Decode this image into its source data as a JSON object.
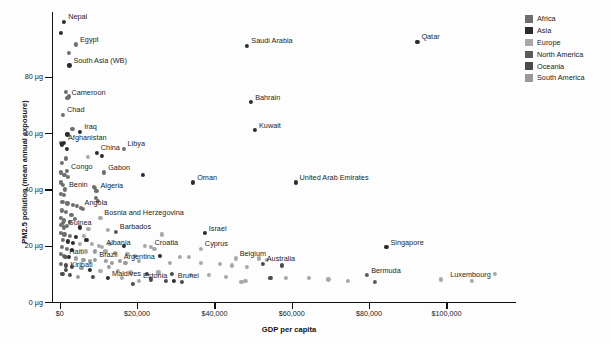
{
  "chart_data": {
    "type": "scatter",
    "title": "",
    "xlabel": "GDP per capita",
    "ylabel": "PM2.5 pollution (mean annual exposure)",
    "xlim": [
      -2000,
      118000
    ],
    "ylim": [
      0,
      103
    ],
    "xticks": [
      0,
      20000,
      40000,
      60000,
      80000,
      100000
    ],
    "xticklabels": [
      "$0",
      "$20,000",
      "$40,000",
      "$60,000",
      "$80,000",
      "$100,000"
    ],
    "yticks": [
      0,
      20,
      40,
      60,
      80
    ],
    "yticklabels": [
      "0 µg",
      "20 µg",
      "40 µg",
      "60 µg",
      "80 µg"
    ],
    "grid": false,
    "legend_position": "top-right",
    "legend": [
      {
        "name": "Africa",
        "color": "#6e6e6e"
      },
      {
        "name": "Asia",
        "color": "#2b2b2b"
      },
      {
        "name": "Europe",
        "color": "#a8a8a8"
      },
      {
        "name": "North America",
        "color": "#5a5a5a"
      },
      {
        "name": "Oceania",
        "color": "#4a4a4a"
      },
      {
        "name": "South America",
        "color": "#9a9a9a"
      }
    ],
    "labeled_points": [
      {
        "name": "Nepal",
        "x": 1150,
        "y": 99.5,
        "group": "Asia",
        "anchor": "right"
      },
      {
        "name": "Egypt",
        "x": 4200,
        "y": 91.5,
        "group": "Africa",
        "anchor": "right"
      },
      {
        "name": "South Asia (WB)",
        "x": 2500,
        "y": 84.0,
        "group": "Asia",
        "anchor": "right"
      },
      {
        "name": "Saudi Arabia",
        "x": 48500,
        "y": 91.0,
        "group": "Asia",
        "anchor": "right"
      },
      {
        "name": "Qatar",
        "x": 92500,
        "y": 92.5,
        "group": "Asia",
        "anchor": "right"
      },
      {
        "name": "Cameroon",
        "x": 2000,
        "y": 72.5,
        "group": "Africa",
        "anchor": "right"
      },
      {
        "name": "Chad",
        "x": 850,
        "y": 66.5,
        "group": "Africa",
        "anchor": "right"
      },
      {
        "name": "Bahrain",
        "x": 49500,
        "y": 71.0,
        "group": "Asia",
        "anchor": "right"
      },
      {
        "name": "Kuwait",
        "x": 50500,
        "y": 61.0,
        "group": "Asia",
        "anchor": "right"
      },
      {
        "name": "Iraq",
        "x": 5300,
        "y": 60.5,
        "group": "Asia",
        "anchor": "right"
      },
      {
        "name": "Afghanistan",
        "x": 1100,
        "y": 56.5,
        "group": "Asia",
        "anchor": "right"
      },
      {
        "name": "China",
        "x": 9600,
        "y": 53.0,
        "group": "Asia",
        "anchor": "right"
      },
      {
        "name": "Libya",
        "x": 16500,
        "y": 54.5,
        "group": "Africa",
        "anchor": "right"
      },
      {
        "name": "Congo",
        "x": 1900,
        "y": 46.5,
        "group": "Africa",
        "anchor": "right"
      },
      {
        "name": "Gabon",
        "x": 11500,
        "y": 46.0,
        "group": "Africa",
        "anchor": "right"
      },
      {
        "name": "Oman",
        "x": 34500,
        "y": 42.5,
        "group": "Asia",
        "anchor": "right"
      },
      {
        "name": "United Arab Emirates",
        "x": 61000,
        "y": 42.5,
        "group": "Asia",
        "anchor": "right"
      },
      {
        "name": "Benin",
        "x": 1350,
        "y": 40.0,
        "group": "Africa",
        "anchor": "right"
      },
      {
        "name": "Algeria",
        "x": 9500,
        "y": 39.5,
        "group": "Africa",
        "anchor": "right"
      },
      {
        "name": "Angola",
        "x": 5400,
        "y": 33.5,
        "group": "Africa",
        "anchor": "right"
      },
      {
        "name": "Bosnia and Herzegovina",
        "x": 10500,
        "y": 30.0,
        "group": "Europe",
        "anchor": "right"
      },
      {
        "name": "Guinea",
        "x": 1100,
        "y": 26.5,
        "group": "Africa",
        "anchor": "right"
      },
      {
        "name": "Barbados",
        "x": 14500,
        "y": 25.0,
        "group": "North America",
        "anchor": "right"
      },
      {
        "name": "Israel",
        "x": 37500,
        "y": 24.5,
        "group": "Asia",
        "anchor": "right"
      },
      {
        "name": "Albania",
        "x": 11000,
        "y": 19.5,
        "group": "Europe",
        "anchor": "right"
      },
      {
        "name": "Croatia",
        "x": 23500,
        "y": 19.5,
        "group": "Europe",
        "anchor": "right"
      },
      {
        "name": "Cyprus",
        "x": 36500,
        "y": 19.0,
        "group": "Europe",
        "anchor": "right"
      },
      {
        "name": "Haiti",
        "x": 1450,
        "y": 16.0,
        "group": "North America",
        "anchor": "right"
      },
      {
        "name": "Brazil",
        "x": 9200,
        "y": 15.0,
        "group": "South America",
        "anchor": "right"
      },
      {
        "name": "Argentina",
        "x": 15500,
        "y": 14.5,
        "group": "South America",
        "anchor": "right"
      },
      {
        "name": "Belgium",
        "x": 45500,
        "y": 15.5,
        "group": "Europe",
        "anchor": "right"
      },
      {
        "name": "Australia",
        "x": 52500,
        "y": 13.5,
        "group": "Oceania",
        "anchor": "right"
      },
      {
        "name": "Singapore",
        "x": 84500,
        "y": 19.5,
        "group": "Asia",
        "anchor": "right"
      },
      {
        "name": "Kiribati",
        "x": 1700,
        "y": 11.5,
        "group": "Oceania",
        "anchor": "right"
      },
      {
        "name": "Maldives",
        "x": 12500,
        "y": 8.5,
        "group": "Asia",
        "anchor": "right"
      },
      {
        "name": "Estonia",
        "x": 20500,
        "y": 7.5,
        "group": "Europe",
        "anchor": "right"
      },
      {
        "name": "Brunei",
        "x": 29500,
        "y": 7.5,
        "group": "Asia",
        "anchor": "right"
      },
      {
        "name": "Bermuda",
        "x": 79500,
        "y": 9.5,
        "group": "North America",
        "anchor": "right"
      },
      {
        "name": "Luxembourg",
        "x": 112500,
        "y": 10.0,
        "group": "Europe",
        "anchor": "left"
      }
    ],
    "unlabeled_points": [
      {
        "x": 300,
        "y": 95.5,
        "group": "Asia"
      },
      {
        "x": 2400,
        "y": 88.5,
        "group": "Africa"
      },
      {
        "x": 1600,
        "y": 74.5,
        "group": "Africa"
      },
      {
        "x": 2300,
        "y": 73.0,
        "group": "Africa"
      },
      {
        "x": 3300,
        "y": 61.5,
        "group": "Africa"
      },
      {
        "x": 2000,
        "y": 59.5,
        "group": "Asia"
      },
      {
        "x": 250,
        "y": 56.5,
        "group": "Africa"
      },
      {
        "x": 600,
        "y": 56.0,
        "group": "Asia"
      },
      {
        "x": 1900,
        "y": 54.5,
        "group": "Asia"
      },
      {
        "x": 7200,
        "y": 51.5,
        "group": "Europe"
      },
      {
        "x": 11000,
        "y": 52.0,
        "group": "Asia"
      },
      {
        "x": 600,
        "y": 49.5,
        "group": "Africa"
      },
      {
        "x": 400,
        "y": 46.0,
        "group": "Africa"
      },
      {
        "x": 1200,
        "y": 45.0,
        "group": "Africa"
      },
      {
        "x": 2100,
        "y": 44.5,
        "group": "Africa"
      },
      {
        "x": 21500,
        "y": 45.0,
        "group": "Asia"
      },
      {
        "x": 300,
        "y": 42.5,
        "group": "Africa"
      },
      {
        "x": 800,
        "y": 41.5,
        "group": "Africa"
      },
      {
        "x": 8800,
        "y": 41.0,
        "group": "Africa"
      },
      {
        "x": 9100,
        "y": 40.5,
        "group": "Africa"
      },
      {
        "x": 400,
        "y": 38.5,
        "group": "Africa"
      },
      {
        "x": 1100,
        "y": 38.0,
        "group": "Africa"
      },
      {
        "x": 9300,
        "y": 37.0,
        "group": "Africa"
      },
      {
        "x": 9800,
        "y": 36.0,
        "group": "Africa"
      },
      {
        "x": 700,
        "y": 35.5,
        "group": "Africa"
      },
      {
        "x": 2000,
        "y": 35.0,
        "group": "Africa"
      },
      {
        "x": 3400,
        "y": 34.5,
        "group": "Africa"
      },
      {
        "x": 4400,
        "y": 34.0,
        "group": "Africa"
      },
      {
        "x": 5900,
        "y": 33.0,
        "group": "Africa"
      },
      {
        "x": 600,
        "y": 32.5,
        "group": "Africa"
      },
      {
        "x": 1500,
        "y": 32.0,
        "group": "Africa"
      },
      {
        "x": 3000,
        "y": 31.0,
        "group": "Africa"
      },
      {
        "x": 250,
        "y": 30.0,
        "group": "Africa"
      },
      {
        "x": 1000,
        "y": 29.0,
        "group": "Africa"
      },
      {
        "x": 2700,
        "y": 28.5,
        "group": "Africa"
      },
      {
        "x": 400,
        "y": 27.5,
        "group": "Africa"
      },
      {
        "x": 1900,
        "y": 27.0,
        "group": "Africa"
      },
      {
        "x": 5300,
        "y": 26.5,
        "group": "Asia"
      },
      {
        "x": 7400,
        "y": 26.0,
        "group": "Europe"
      },
      {
        "x": 12500,
        "y": 25.5,
        "group": "Europe"
      },
      {
        "x": 26500,
        "y": 24.0,
        "group": "Europe"
      },
      {
        "x": 300,
        "y": 24.5,
        "group": "Africa"
      },
      {
        "x": 1200,
        "y": 24.0,
        "group": "Africa"
      },
      {
        "x": 2600,
        "y": 23.5,
        "group": "Africa"
      },
      {
        "x": 4100,
        "y": 23.0,
        "group": "Asia"
      },
      {
        "x": 6300,
        "y": 23.5,
        "group": "Europe"
      },
      {
        "x": 900,
        "y": 22.0,
        "group": "Africa"
      },
      {
        "x": 2100,
        "y": 21.5,
        "group": "Asia"
      },
      {
        "x": 3500,
        "y": 21.0,
        "group": "Asia"
      },
      {
        "x": 5200,
        "y": 20.5,
        "group": "Europe"
      },
      {
        "x": 8400,
        "y": 20.5,
        "group": "Europe"
      },
      {
        "x": 10200,
        "y": 20.0,
        "group": "Europe"
      },
      {
        "x": 13000,
        "y": 20.5,
        "group": "Europe"
      },
      {
        "x": 16500,
        "y": 20.0,
        "group": "Asia"
      },
      {
        "x": 22000,
        "y": 20.0,
        "group": "Europe"
      },
      {
        "x": 24500,
        "y": 19.0,
        "group": "Europe"
      },
      {
        "x": 500,
        "y": 19.5,
        "group": "Africa"
      },
      {
        "x": 1800,
        "y": 19.0,
        "group": "Africa"
      },
      {
        "x": 3100,
        "y": 18.5,
        "group": "Asia"
      },
      {
        "x": 6800,
        "y": 18.0,
        "group": "Europe"
      },
      {
        "x": 9000,
        "y": 18.0,
        "group": "South America"
      },
      {
        "x": 11800,
        "y": 18.0,
        "group": "Europe"
      },
      {
        "x": 14200,
        "y": 17.5,
        "group": "Europe"
      },
      {
        "x": 17500,
        "y": 17.0,
        "group": "Europe"
      },
      {
        "x": 19500,
        "y": 16.5,
        "group": "Europe"
      },
      {
        "x": 26000,
        "y": 16.5,
        "group": "Asia"
      },
      {
        "x": 31000,
        "y": 16.0,
        "group": "Europe"
      },
      {
        "x": 33500,
        "y": 16.0,
        "group": "Europe"
      },
      {
        "x": 400,
        "y": 17.0,
        "group": "Africa"
      },
      {
        "x": 1100,
        "y": 16.5,
        "group": "Africa"
      },
      {
        "x": 2400,
        "y": 16.0,
        "group": "Asia"
      },
      {
        "x": 4200,
        "y": 15.5,
        "group": "South America"
      },
      {
        "x": 6100,
        "y": 15.0,
        "group": "South America"
      },
      {
        "x": 7900,
        "y": 14.5,
        "group": "South America"
      },
      {
        "x": 12000,
        "y": 14.5,
        "group": "South America"
      },
      {
        "x": 13500,
        "y": 14.0,
        "group": "South America"
      },
      {
        "x": 17000,
        "y": 14.0,
        "group": "South America"
      },
      {
        "x": 20500,
        "y": 14.5,
        "group": "Europe"
      },
      {
        "x": 28500,
        "y": 14.0,
        "group": "Europe"
      },
      {
        "x": 36500,
        "y": 14.0,
        "group": "Europe"
      },
      {
        "x": 41500,
        "y": 13.5,
        "group": "Europe"
      },
      {
        "x": 44500,
        "y": 13.0,
        "group": "Europe"
      },
      {
        "x": 48500,
        "y": 12.5,
        "group": "Europe"
      },
      {
        "x": 51500,
        "y": 15.5,
        "group": "Europe"
      },
      {
        "x": 53500,
        "y": 15.0,
        "group": "Europe"
      },
      {
        "x": 57500,
        "y": 13.0,
        "group": "Oceania"
      },
      {
        "x": 300,
        "y": 13.5,
        "group": "Africa"
      },
      {
        "x": 1500,
        "y": 13.0,
        "group": "Oceania"
      },
      {
        "x": 3200,
        "y": 12.5,
        "group": "Oceania"
      },
      {
        "x": 5600,
        "y": 12.0,
        "group": "South America"
      },
      {
        "x": 7700,
        "y": 11.5,
        "group": "Asia"
      },
      {
        "x": 10500,
        "y": 11.0,
        "group": "Europe"
      },
      {
        "x": 15000,
        "y": 11.0,
        "group": "Europe"
      },
      {
        "x": 18500,
        "y": 10.5,
        "group": "Europe"
      },
      {
        "x": 22500,
        "y": 10.0,
        "group": "Oceania"
      },
      {
        "x": 25500,
        "y": 10.5,
        "group": "Europe"
      },
      {
        "x": 29000,
        "y": 10.0,
        "group": "Oceania"
      },
      {
        "x": 34000,
        "y": 9.5,
        "group": "Europe"
      },
      {
        "x": 38500,
        "y": 9.5,
        "group": "Europe"
      },
      {
        "x": 43000,
        "y": 9.0,
        "group": "Europe"
      },
      {
        "x": 47000,
        "y": 7.0,
        "group": "Europe"
      },
      {
        "x": 48000,
        "y": 7.5,
        "group": "Europe"
      },
      {
        "x": 54500,
        "y": 8.5,
        "group": "Oceania"
      },
      {
        "x": 58500,
        "y": 8.5,
        "group": "Europe"
      },
      {
        "x": 64500,
        "y": 8.5,
        "group": "Europe"
      },
      {
        "x": 69500,
        "y": 8.0,
        "group": "Europe"
      },
      {
        "x": 74500,
        "y": 7.5,
        "group": "Europe"
      },
      {
        "x": 81500,
        "y": 7.0,
        "group": "North America"
      },
      {
        "x": 98500,
        "y": 8.0,
        "group": "Europe"
      },
      {
        "x": 106500,
        "y": 7.5,
        "group": "Europe"
      },
      {
        "x": 700,
        "y": 10.0,
        "group": "Oceania"
      },
      {
        "x": 2600,
        "y": 9.5,
        "group": "Oceania"
      },
      {
        "x": 4800,
        "y": 9.0,
        "group": "South America"
      },
      {
        "x": 8500,
        "y": 9.0,
        "group": "Oceania"
      },
      {
        "x": 16000,
        "y": 8.5,
        "group": "Europe"
      },
      {
        "x": 23500,
        "y": 8.0,
        "group": "Oceania"
      },
      {
        "x": 27500,
        "y": 7.5,
        "group": "Oceania"
      },
      {
        "x": 31500,
        "y": 7.0,
        "group": "Oceania"
      },
      {
        "x": 19000,
        "y": 6.5,
        "group": "Oceania"
      },
      {
        "x": 12800,
        "y": 12.5,
        "group": "South America"
      },
      {
        "x": 6900,
        "y": 22.0,
        "group": "Asia"
      },
      {
        "x": 3900,
        "y": 29.5,
        "group": "Africa"
      },
      {
        "x": 1700,
        "y": 51.0,
        "group": "Africa"
      },
      {
        "x": 800,
        "y": 28.0,
        "group": "Africa"
      }
    ]
  },
  "plot": {
    "x_left_px": 52,
    "x_right_px": 516,
    "y_top_px": 12,
    "y_bottom_px": 302
  }
}
